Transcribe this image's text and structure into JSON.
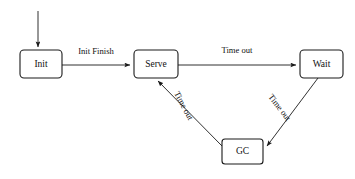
{
  "diagram": {
    "type": "state-machine",
    "background_color": "#ffffff",
    "stroke_color": "#1a1a1a",
    "text_color": "#111111",
    "nodes": [
      {
        "id": "init",
        "label": "Init",
        "x": 20,
        "y": 50,
        "w": 42,
        "h": 28,
        "rx": 4
      },
      {
        "id": "serve",
        "label": "Serve",
        "x": 134,
        "y": 50,
        "w": 44,
        "h": 28,
        "rx": 4
      },
      {
        "id": "wait",
        "label": "Wait",
        "x": 300,
        "y": 50,
        "w": 43,
        "h": 28,
        "rx": 4
      },
      {
        "id": "gc",
        "label": "GC",
        "x": 222,
        "y": 139,
        "w": 41,
        "h": 25,
        "rx": 3
      }
    ],
    "edges": [
      {
        "id": "start-init",
        "from": "start",
        "to": "init",
        "label": "",
        "rotation": 0
      },
      {
        "id": "init-serve",
        "from": "init",
        "to": "serve",
        "label": "Init Finish",
        "rotation": 0
      },
      {
        "id": "serve-wait",
        "from": "serve",
        "to": "wait",
        "label": "Time out",
        "rotation": 0
      },
      {
        "id": "wait-gc",
        "from": "wait",
        "to": "gc",
        "label": "Time out",
        "rotation": 57
      },
      {
        "id": "gc-serve",
        "from": "gc",
        "to": "serve",
        "label": "Time out",
        "rotation": 62
      }
    ]
  }
}
